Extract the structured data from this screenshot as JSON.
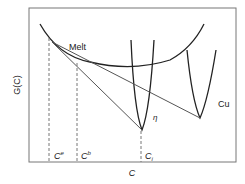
{
  "diagram": {
    "ylabel": "G(C)",
    "xlabel": "C",
    "curves": {
      "melt": "Melt",
      "eta": "η",
      "cu": "Cu"
    },
    "markers": {
      "ce_base": "C",
      "ce_sup": "e",
      "cb_base": "C",
      "cb_sup": "b",
      "ci_base": "C",
      "ci_sub": "i"
    }
  }
}
